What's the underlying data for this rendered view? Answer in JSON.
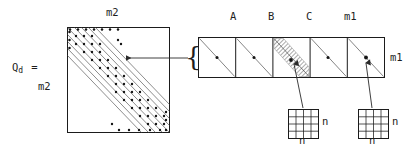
{
  "figure": {
    "type": "block-matrix-structure-diagram",
    "title_text": "",
    "background_color": "#ffffff",
    "ink_color": "#1b1b1b",
    "width": 417,
    "height": 150
  },
  "left_block": {
    "equation_label": "Q",
    "equation_subscript": "d",
    "equals_sign": "=",
    "dimension_label": "m2",
    "matrix": {
      "top_label": "m2",
      "shape": "square",
      "band_line_count": 5,
      "band_orientation": "main-diagonal",
      "band_has_dots": true,
      "dots_per_line": 7,
      "border_color": "#1b1b1b"
    }
  },
  "connector": {
    "arrow_label": "",
    "arrow_direction": "left",
    "brace_glyph": "{"
  },
  "right_block": {
    "strip_label_right": "m1",
    "cells": [
      {
        "label": "",
        "hatched": false,
        "has_diagonal": true,
        "has_dot": true
      },
      {
        "label": "A",
        "hatched": false,
        "has_diagonal": true,
        "has_dot": true
      },
      {
        "label": "B",
        "hatched": true,
        "has_diagonal": true,
        "has_dot": true
      },
      {
        "label": "C",
        "hatched": false,
        "has_diagonal": true,
        "has_dot": true
      },
      {
        "label": "m1",
        "hatched": false,
        "has_diagonal": true,
        "has_dot": true
      }
    ],
    "column_labels": [
      "A",
      "B",
      "C",
      "m1"
    ]
  },
  "detail_grids": [
    {
      "name": "grid-b",
      "rows": 4,
      "cols": 4,
      "label_right": "n",
      "label_below": "n",
      "points_to_cell": "B"
    },
    {
      "name": "grid-m1",
      "rows": 4,
      "cols": 4,
      "label_right": "n",
      "label_below": "n",
      "points_to_cell": "m1"
    }
  ]
}
